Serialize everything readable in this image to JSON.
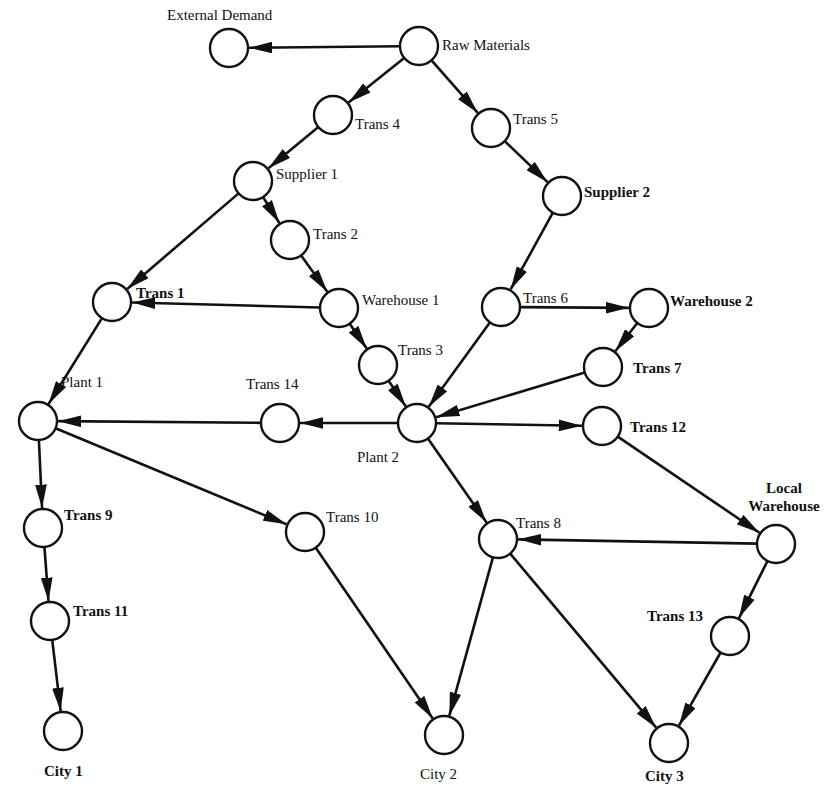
{
  "diagram": {
    "type": "supply-chain-network",
    "nodes": [
      {
        "id": "external_demand",
        "label": "External Demand",
        "x": 229,
        "y": 48
      },
      {
        "id": "raw_materials",
        "label": "Raw Materials",
        "x": 419,
        "y": 46
      },
      {
        "id": "trans4",
        "label": "Trans 4",
        "x": 333,
        "y": 115
      },
      {
        "id": "trans5",
        "label": "Trans 5",
        "x": 491,
        "y": 128
      },
      {
        "id": "supplier1",
        "label": "Supplier 1",
        "x": 253,
        "y": 181
      },
      {
        "id": "supplier2",
        "label": "Supplier 2",
        "x": 562,
        "y": 196
      },
      {
        "id": "trans2",
        "label": "Trans 2",
        "x": 290,
        "y": 240
      },
      {
        "id": "trans1",
        "label": "Trans 1",
        "x": 112,
        "y": 302
      },
      {
        "id": "warehouse1",
        "label": "Warehouse 1",
        "x": 339,
        "y": 308
      },
      {
        "id": "trans6",
        "label": "Trans 6",
        "x": 501,
        "y": 307
      },
      {
        "id": "warehouse2",
        "label": "Warehouse 2",
        "x": 649,
        "y": 308
      },
      {
        "id": "trans3",
        "label": "Trans 3",
        "x": 378,
        "y": 365
      },
      {
        "id": "trans7",
        "label": "Trans 7",
        "x": 603,
        "y": 367
      },
      {
        "id": "plant1",
        "label": "Plant 1",
        "x": 38,
        "y": 421
      },
      {
        "id": "trans14",
        "label": "Trans 14",
        "x": 280,
        "y": 423
      },
      {
        "id": "plant2",
        "label": "Plant 2",
        "x": 417,
        "y": 423
      },
      {
        "id": "trans12",
        "label": "Trans 12",
        "x": 602,
        "y": 426
      },
      {
        "id": "trans9",
        "label": "Trans 9",
        "x": 43,
        "y": 528
      },
      {
        "id": "trans10",
        "label": "Trans 10",
        "x": 305,
        "y": 532
      },
      {
        "id": "trans8",
        "label": "Trans 8",
        "x": 498,
        "y": 539
      },
      {
        "id": "local_warehouse",
        "label": "Local Warehouse",
        "x": 776,
        "y": 544
      },
      {
        "id": "trans11",
        "label": "Trans 11",
        "x": 50,
        "y": 621
      },
      {
        "id": "trans13",
        "label": "Trans 13",
        "x": 730,
        "y": 636
      },
      {
        "id": "city1",
        "label": "City 1",
        "x": 63,
        "y": 731
      },
      {
        "id": "city2",
        "label": "City 2",
        "x": 444,
        "y": 735
      },
      {
        "id": "city3",
        "label": "City 3",
        "x": 669,
        "y": 743
      }
    ],
    "edges": [
      {
        "from": "raw_materials",
        "to": "external_demand"
      },
      {
        "from": "raw_materials",
        "to": "trans4"
      },
      {
        "from": "raw_materials",
        "to": "trans5"
      },
      {
        "from": "trans4",
        "to": "supplier1"
      },
      {
        "from": "trans5",
        "to": "supplier2"
      },
      {
        "from": "supplier1",
        "to": "trans1"
      },
      {
        "from": "supplier1",
        "to": "trans2"
      },
      {
        "from": "trans2",
        "to": "warehouse1"
      },
      {
        "from": "warehouse1",
        "to": "trans1"
      },
      {
        "from": "warehouse1",
        "to": "trans3"
      },
      {
        "from": "supplier2",
        "to": "trans6"
      },
      {
        "from": "trans6",
        "to": "warehouse2"
      },
      {
        "from": "trans6",
        "to": "plant2"
      },
      {
        "from": "warehouse2",
        "to": "trans7"
      },
      {
        "from": "trans7",
        "to": "plant2"
      },
      {
        "from": "trans3",
        "to": "plant2"
      },
      {
        "from": "trans1",
        "to": "plant1"
      },
      {
        "from": "plant2",
        "to": "trans14"
      },
      {
        "from": "trans14",
        "to": "plant1"
      },
      {
        "from": "plant2",
        "to": "trans12"
      },
      {
        "from": "plant2",
        "to": "trans8"
      },
      {
        "from": "plant1",
        "to": "trans9"
      },
      {
        "from": "plant1",
        "to": "trans10"
      },
      {
        "from": "trans9",
        "to": "trans11"
      },
      {
        "from": "trans11",
        "to": "city1"
      },
      {
        "from": "trans10",
        "to": "city2"
      },
      {
        "from": "trans8",
        "to": "city2"
      },
      {
        "from": "trans8",
        "to": "city3"
      },
      {
        "from": "trans12",
        "to": "local_warehouse"
      },
      {
        "from": "local_warehouse",
        "to": "trans8"
      },
      {
        "from": "local_warehouse",
        "to": "trans13"
      },
      {
        "from": "trans13",
        "to": "city3"
      }
    ]
  },
  "labels": {
    "external_demand": "External Demand",
    "raw_materials": "Raw Materials",
    "trans4": "Trans 4",
    "trans5": "Trans 5",
    "supplier1": "Supplier 1",
    "supplier2": "Supplier 2",
    "trans2": "Trans 2",
    "trans1": "Trans 1",
    "warehouse1": "Warehouse 1",
    "trans6": "Trans 6",
    "warehouse2": "Warehouse 2",
    "trans3": "Trans 3",
    "trans7": "Trans 7",
    "plant1": "Plant 1",
    "trans14": "Trans 14",
    "plant2": "Plant 2",
    "trans12": "Trans 12",
    "local_warehouse_line1": "Local",
    "local_warehouse_line2": "Warehouse",
    "trans9": "Trans 9",
    "trans10": "Trans 10",
    "trans8": "Trans 8",
    "trans11": "Trans 11",
    "trans13": "Trans 13",
    "city1": "City 1",
    "city2": "City 2",
    "city3": "City 3"
  },
  "style": {
    "node_radius": 19,
    "stroke_color": "#111111",
    "background": "#ffffff"
  }
}
